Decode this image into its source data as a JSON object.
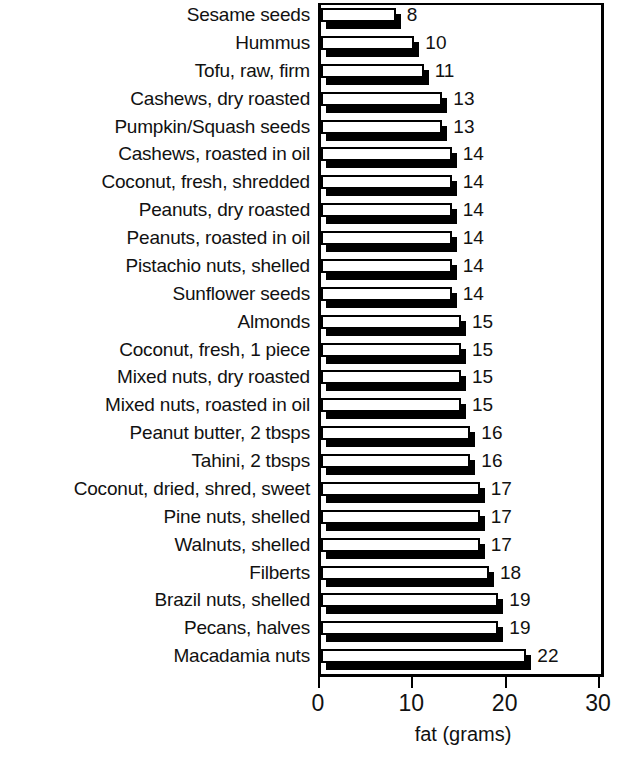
{
  "chart_data": {
    "type": "bar",
    "orientation": "horizontal",
    "title": "",
    "xlabel": "fat (grams)",
    "ylabel": "",
    "xlim": [
      0,
      30
    ],
    "xticks": [
      0,
      10,
      20,
      30
    ],
    "xtick_labels": [
      "0",
      "10",
      "20",
      "30"
    ],
    "grid": false,
    "legend": null,
    "value_labels": true,
    "categories": [
      "Sesame seeds",
      "Hummus",
      "Tofu, raw, firm",
      "Cashews, dry roasted",
      "Pumpkin/Squash seeds",
      "Cashews, roasted in oil",
      "Coconut, fresh, shredded",
      "Peanuts, dry roasted",
      "Peanuts, roasted in oil",
      "Pistachio nuts, shelled",
      "Sunflower seeds",
      "Almonds",
      "Coconut, fresh, 1 piece",
      "Mixed nuts, dry roasted",
      "Mixed nuts, roasted in oil",
      "Peanut butter, 2 tbsps",
      "Tahini, 2 tbsps",
      "Coconut, dried, shred, sweet",
      "Pine nuts, shelled",
      "Walnuts, shelled",
      "Filberts",
      "Brazil nuts, shelled",
      "Pecans, halves",
      "Macadamia nuts"
    ],
    "values": [
      8,
      10,
      11,
      13,
      13,
      14,
      14,
      14,
      14,
      14,
      14,
      15,
      15,
      15,
      15,
      16,
      16,
      17,
      17,
      17,
      18,
      19,
      19,
      22
    ],
    "value_label_text": [
      "8",
      "10",
      "11",
      "13",
      "13",
      "14",
      "14",
      "14",
      "14",
      "14",
      "14",
      "15",
      "15",
      "15",
      "15",
      "16",
      "16",
      "17",
      "17",
      "17",
      "18",
      "19",
      "19",
      "22"
    ],
    "colors": {
      "bar_face": "#ffffff",
      "bar_outline": "#000000",
      "bar_shadow": "#000000",
      "axis": "#000000",
      "text": "#111111",
      "background": "#ffffff"
    }
  }
}
